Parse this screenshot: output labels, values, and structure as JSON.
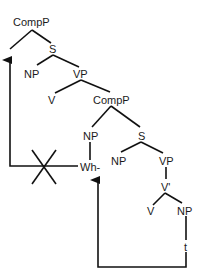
{
  "diagram": {
    "type": "syntax-tree",
    "nodes": {
      "comp_p_top": "CompP",
      "s_top": "S",
      "np_subject": "NP",
      "vp_top": "VP",
      "v_top": "V",
      "comp_p_embedded": "CompP",
      "np_spec": "NP",
      "s_embedded": "S",
      "wh": "Wh-",
      "np_embedded_subject": "NP",
      "vp_embedded": "VP",
      "v_bar": "V'",
      "v_embedded": "V",
      "np_object": "NP",
      "trace": "t"
    },
    "arrows": [
      {
        "from": "trace",
        "to": "wh",
        "label": "wh-movement"
      },
      {
        "from": "wh",
        "to": "comp_p_top",
        "label": "blocked movement",
        "blocked": true
      }
    ]
  }
}
